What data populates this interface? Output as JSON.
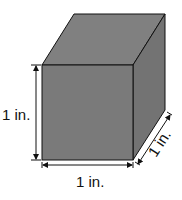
{
  "figure": {
    "colors": {
      "front_face": "#7a7a7a",
      "top_face": "#808080",
      "side_face": "#737373",
      "edge": "#111111"
    },
    "labels": {
      "height": "1 in.",
      "width": "1 in.",
      "depth": "1 in."
    }
  }
}
